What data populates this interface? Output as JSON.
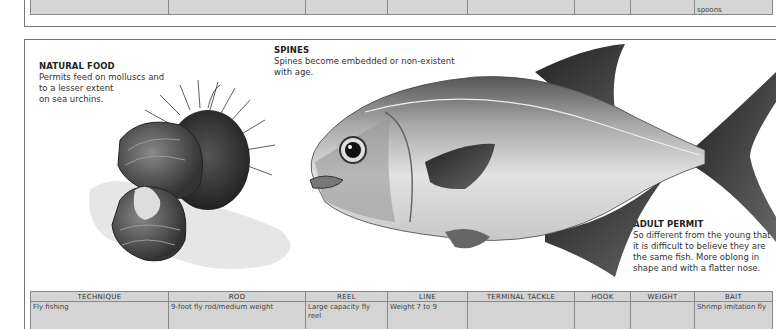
{
  "previous_table": {
    "bait_tail": "spoons"
  },
  "captions": {
    "natural_food": {
      "title": "NATURAL FOOD",
      "lines": [
        "Permits feed on molluscs and",
        "to a lesser extent",
        "on sea urchins."
      ]
    },
    "spines": {
      "title": "SPINES",
      "lines": [
        "Spines become embedded or non-existent",
        "with age."
      ]
    },
    "adult_permit": {
      "title": "ADULT PERMIT",
      "lines": [
        "So different from the young that",
        "it is difficult to believe they are",
        "the same fish. More oblong in",
        "shape and with a flatter nose."
      ]
    }
  },
  "illustrations": {
    "left": "sea-urchin-and-mollusc",
    "right": "adult-permit-fish"
  },
  "tackle_table": {
    "headers": [
      "TECHNIQUE",
      "ROD",
      "REEL",
      "LINE",
      "TERMINAL TACKLE",
      "HOOK",
      "WEIGHT",
      "BAIT"
    ],
    "rows": [
      [
        "Fly fishing",
        "9-foot fly rod/medium weight",
        "Large capacity fly reel",
        "Weight 7 to 9",
        "",
        "",
        "",
        "Shrimp imitation fly"
      ]
    ]
  },
  "colors": {
    "table_fill": "#d4d4d4",
    "border": "#888888",
    "text": "#333333"
  }
}
